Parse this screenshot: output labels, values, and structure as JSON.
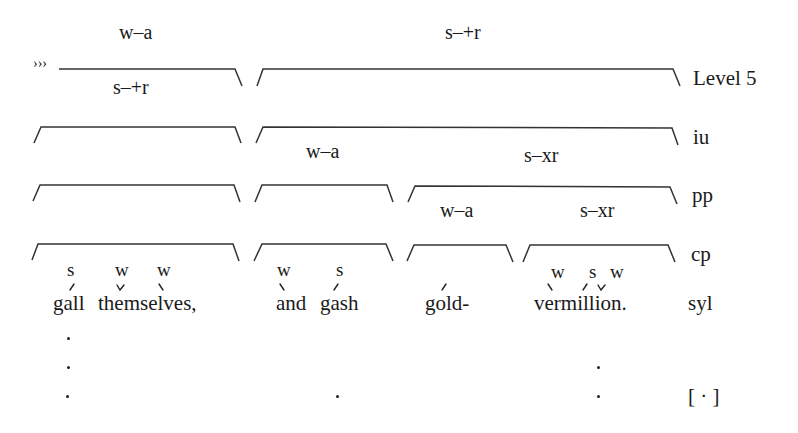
{
  "prefix": "›››",
  "levels": [
    {
      "name": "Level 5",
      "label": "Level 5",
      "brackets": [
        {
          "above": "w–a",
          "below": "s–+r"
        },
        {
          "above": "s–+r"
        }
      ]
    },
    {
      "name": "iu",
      "label": "iu",
      "brackets": [
        {},
        {
          "below_left": "w–a",
          "below_right": "s–xr"
        }
      ]
    },
    {
      "name": "pp",
      "label": "pp",
      "brackets": [
        {},
        {},
        {
          "below_left": "w–a",
          "below_right": "s–xr"
        }
      ]
    },
    {
      "name": "cp",
      "label": "cp",
      "brackets": [
        {},
        {},
        {},
        {}
      ]
    }
  ],
  "stress_marks": [
    {
      "mark": "s",
      "word": "gall"
    },
    {
      "mark": "w",
      "word": "themselves"
    },
    {
      "mark": "w",
      "word": "themselves"
    },
    {
      "mark": "w",
      "word": "and"
    },
    {
      "mark": "s",
      "word": "gash"
    },
    {
      "mark": "w",
      "word": "vermillion"
    },
    {
      "mark": "s",
      "word": "vermillion"
    },
    {
      "mark": "w",
      "word": "vermillion"
    }
  ],
  "syllables": {
    "label": "syl",
    "words": [
      "gall",
      "themselves,",
      "and",
      "gash",
      "gold-",
      "vermillion."
    ]
  },
  "pause": {
    "label": "[ · ]"
  }
}
